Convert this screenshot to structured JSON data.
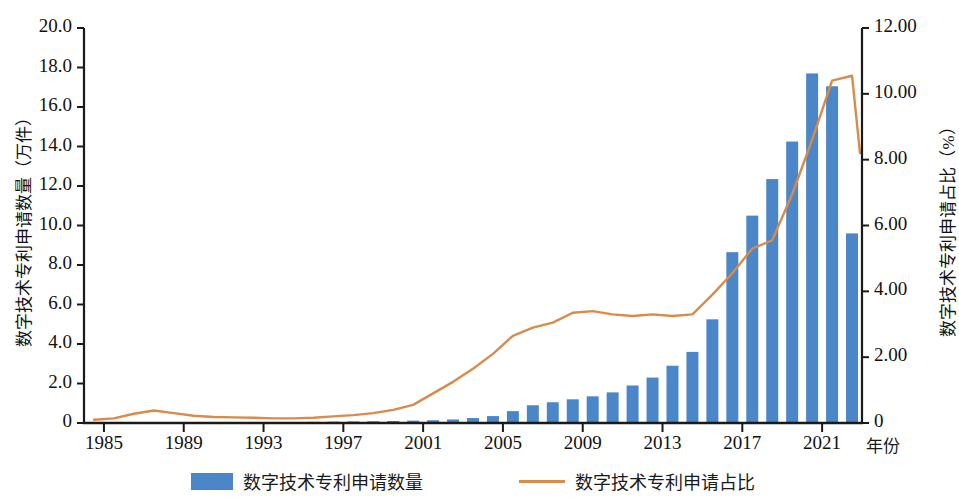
{
  "axes": {
    "y_left_title": "数字技术专利申请数量（万件）",
    "y_right_title": "数字技术专利申请占比（%）",
    "x_title": "年份",
    "y_left_ticks": [
      "0",
      "2.0",
      "4.0",
      "6.0",
      "8.0",
      "10.0",
      "12.0",
      "14.0",
      "16.0",
      "18.0",
      "20.0"
    ],
    "y_right_ticks": [
      "0",
      "2.00",
      "4.00",
      "6.00",
      "8.00",
      "10.00",
      "12.00"
    ],
    "x_ticks": [
      "1985",
      "1989",
      "1993",
      "1997",
      "2001",
      "2005",
      "2009",
      "2013",
      "2017",
      "2021"
    ]
  },
  "legend": {
    "bar_label": "数字技术专利申请数量",
    "line_label": "数字技术专利申请占比"
  },
  "colors": {
    "bar": "#4a86c8",
    "line": "#d98b4a",
    "axis": "#1a1a1a"
  },
  "chart_data": {
    "type": "bar",
    "title": "",
    "xlabel": "年份",
    "ylabel": "数字技术专利申请数量（万件）",
    "y2label": "数字技术专利申请占比（%）",
    "ylim": [
      0,
      20
    ],
    "y2lim": [
      0,
      12
    ],
    "xlim": [
      1985,
      2022
    ],
    "grid": false,
    "legend_position": "bottom",
    "categories": [
      1985,
      1986,
      1987,
      1988,
      1989,
      1990,
      1991,
      1992,
      1993,
      1994,
      1995,
      1996,
      1997,
      1998,
      1999,
      2000,
      2001,
      2002,
      2003,
      2004,
      2005,
      2006,
      2007,
      2008,
      2009,
      2010,
      2011,
      2012,
      2013,
      2014,
      2015,
      2016,
      2017,
      2018,
      2019,
      2020,
      2021,
      2022
    ],
    "series": [
      {
        "name": "数字技术专利申请数量",
        "type": "bar",
        "axis": "left",
        "unit": "万件",
        "values": [
          0.0,
          0.01,
          0.01,
          0.01,
          0.01,
          0.01,
          0.01,
          0.01,
          0.02,
          0.02,
          0.02,
          0.03,
          0.03,
          0.04,
          0.05,
          0.06,
          0.07,
          0.08,
          0.1,
          0.12,
          0.16,
          0.3,
          0.55,
          0.75,
          0.95,
          1.05,
          1.15,
          1.45,
          1.85,
          2.25,
          2.9,
          3.6,
          5.25,
          8.65,
          10.5,
          12.35,
          14.25,
          17.7
        ]
      },
      {
        "name": "数字技术专利申请占比",
        "type": "line",
        "axis": "right",
        "unit": "%",
        "values": [
          0.08,
          0.18,
          0.3,
          0.33,
          0.25,
          0.18,
          0.14,
          0.12,
          0.11,
          0.11,
          0.12,
          0.16,
          0.2,
          0.25,
          0.3,
          0.45,
          0.62,
          0.95,
          1.3,
          1.65,
          2.05,
          2.55,
          2.9,
          3.05,
          3.3,
          3.45,
          3.35,
          3.3,
          3.35,
          3.3,
          3.25,
          3.55,
          4.0,
          4.6,
          5.2,
          5.5,
          6.35,
          7.1
        ]
      }
    ],
    "note": "最后两根柱为 2021(17.0) 与 2022(9.6)；占比末端由 10.4 降至 8.2"
  },
  "bars_px": {
    "values": [
      0.02,
      0.03,
      0.03,
      0.03,
      0.03,
      0.03,
      0.03,
      0.04,
      0.04,
      0.05,
      0.05,
      0.06,
      0.07,
      0.08,
      0.09,
      0.1,
      0.12,
      0.14,
      0.18,
      0.25,
      0.35,
      0.6,
      0.9,
      1.05,
      1.2,
      1.35,
      1.55,
      1.9,
      2.3,
      2.9,
      3.6,
      5.25,
      8.65,
      10.5,
      12.35,
      14.25,
      17.7,
      17.05,
      9.6
    ],
    "years": [
      1984,
      1985,
      1986,
      1987,
      1988,
      1989,
      1990,
      1991,
      1992,
      1993,
      1994,
      1995,
      1996,
      1997,
      1998,
      1999,
      2000,
      2001,
      2002,
      2003,
      2004,
      2005,
      2006,
      2007,
      2008,
      2009,
      2010,
      2011,
      2012,
      2013,
      2014,
      2015,
      2016,
      2017,
      2018,
      2019,
      2020,
      2021,
      2022
    ]
  },
  "line_px": {
    "years": [
      1984,
      1985,
      1986,
      1987,
      1988,
      1989,
      1990,
      1991,
      1992,
      1993,
      1994,
      1995,
      1996,
      1997,
      1998,
      1999,
      2000,
      2001,
      2002,
      2003,
      2004,
      2005,
      2006,
      2007,
      2008,
      2009,
      2010,
      2011,
      2012,
      2013,
      2014,
      2015,
      2016,
      2017,
      2018,
      2019,
      2020,
      2021,
      2022
    ],
    "values": [
      0.1,
      0.14,
      0.28,
      0.38,
      0.3,
      0.22,
      0.18,
      0.17,
      0.16,
      0.14,
      0.14,
      0.16,
      0.2,
      0.24,
      0.3,
      0.4,
      0.55,
      0.9,
      1.25,
      1.65,
      2.1,
      2.65,
      2.9,
      3.05,
      3.35,
      3.4,
      3.3,
      3.25,
      3.3,
      3.25,
      3.3,
      3.9,
      4.55,
      5.3,
      5.55,
      6.95,
      8.6,
      10.4,
      10.55
    ],
    "tail_value": 8.2
  }
}
